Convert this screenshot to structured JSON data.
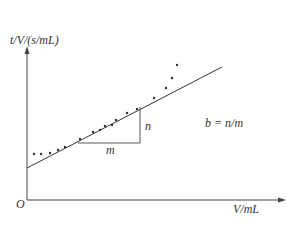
{
  "chart_data": {
    "type": "scatter",
    "title": "",
    "xlabel": "V/mL",
    "ylabel": "t/V/(s/mL)",
    "origin_label": "O",
    "annotation": "b = n/m",
    "triangle_labels": {
      "run": "m",
      "rise": "n"
    },
    "fit_line": {
      "x0": 27,
      "y0": 168,
      "x1": 222,
      "y1": 67
    },
    "points": [
      {
        "x": 34,
        "y": 154
      },
      {
        "x": 41,
        "y": 154
      },
      {
        "x": 50,
        "y": 153
      },
      {
        "x": 58,
        "y": 150
      },
      {
        "x": 65,
        "y": 147
      },
      {
        "x": 80,
        "y": 139
      },
      {
        "x": 93,
        "y": 132
      },
      {
        "x": 100,
        "y": 130
      },
      {
        "x": 105,
        "y": 126
      },
      {
        "x": 112,
        "y": 125
      },
      {
        "x": 116,
        "y": 120
      },
      {
        "x": 127,
        "y": 113
      },
      {
        "x": 137,
        "y": 109
      },
      {
        "x": 154,
        "y": 98
      },
      {
        "x": 166,
        "y": 88
      },
      {
        "x": 172,
        "y": 78
      },
      {
        "x": 177,
        "y": 65
      }
    ],
    "grid": false,
    "legend": null
  },
  "labels": {
    "y_axis": "t/V/(s/mL)",
    "x_axis": "V/mL",
    "origin": "O",
    "formula": "b = n/m",
    "m": "m",
    "n": "n"
  }
}
